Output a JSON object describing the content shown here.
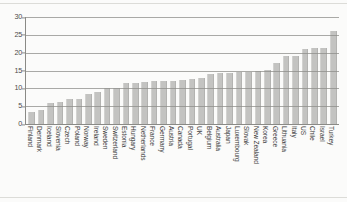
{
  "chart_data": {
    "type": "bar",
    "title": "",
    "subtitle": "",
    "xlabel": "",
    "ylabel": "",
    "ylim": [
      0,
      30
    ],
    "yticks": [
      0,
      5,
      10,
      15,
      20,
      25,
      30
    ],
    "grid": true,
    "legend": null,
    "orientation": "vertical",
    "bar_color": "#c3c3c1",
    "categories": [
      "Finland",
      "Denmark",
      "Iceland",
      "Slovenia",
      "Czech",
      "Poland",
      "Norway",
      "Ireland",
      "Sweden",
      "Switzerland",
      "Estonia",
      "Hungary",
      "Netherlands",
      "France",
      "Germany",
      "Austria",
      "Canada",
      "Portugal",
      "UK",
      "Belgium",
      "Australia",
      "Japan",
      "Luxembourg",
      "Slovak",
      "New Zealand",
      "Korea",
      "Greece",
      "Lithuania",
      "Italy",
      "US",
      "Chile",
      "Israel",
      "Turkey"
    ],
    "values": [
      3.5,
      4.0,
      6.0,
      6.3,
      7.0,
      7.0,
      8.3,
      9.0,
      10.0,
      10.0,
      11.4,
      11.6,
      11.8,
      12.0,
      12.0,
      12.2,
      12.3,
      12.5,
      13.0,
      14.0,
      14.2,
      14.4,
      14.6,
      14.7,
      15.0,
      15.2,
      17.0,
      19.0,
      19.2,
      21.0,
      21.3,
      21.3,
      26.0
    ]
  },
  "axis": {
    "y_tick_labels": [
      "30",
      "25",
      "20",
      "15",
      "10",
      "5",
      "0"
    ]
  }
}
